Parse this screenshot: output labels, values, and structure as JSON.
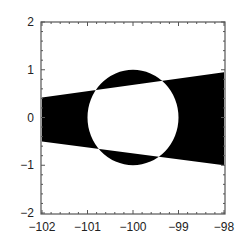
{
  "chart_data": {
    "type": "region",
    "title": "",
    "xlabel": "",
    "ylabel": "",
    "xlim": [
      -102,
      -98
    ],
    "ylim": [
      -2,
      2
    ],
    "grid": false,
    "legend": null,
    "x_ticks": [
      -102,
      -101,
      -100,
      -99,
      -98
    ],
    "y_ticks": [
      -2,
      -1,
      0,
      1,
      2
    ],
    "x_tick_labels": [
      "−102",
      "−101",
      "−100",
      "−99",
      "−98"
    ],
    "y_tick_labels": [
      "−2",
      "−1",
      "0",
      "1",
      "2"
    ],
    "fill_color": "#000000",
    "background_color": "#ffffff",
    "shapes": {
      "wedge": {
        "left_x": -102,
        "left_top": 0.42,
        "left_bottom": -0.5,
        "right_x": -98,
        "right_top": 0.95,
        "right_bottom": -1.0
      },
      "circle": {
        "cx": -100,
        "cy": 0,
        "r": 1.0
      }
    }
  }
}
